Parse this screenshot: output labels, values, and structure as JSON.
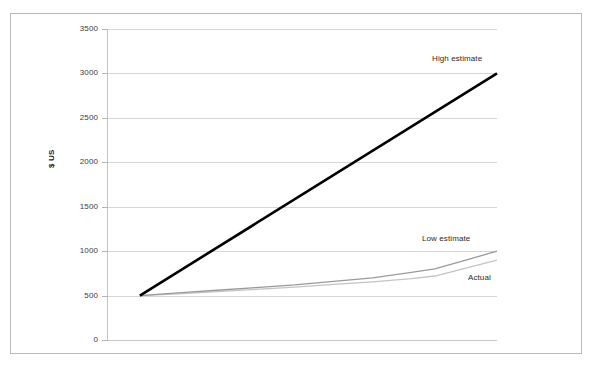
{
  "chart_data": {
    "type": "line",
    "title": "",
    "subtitle": "",
    "xlabel": "",
    "ylabel": "$ US",
    "ylim": [
      0,
      3500
    ],
    "xlim": [
      0,
      10
    ],
    "y_ticks": [
      0,
      500,
      1000,
      1500,
      2000,
      2500,
      3000,
      3500
    ],
    "y_tick_labels": [
      "0",
      "500",
      "1000",
      "1500",
      "2000",
      "2500",
      "3000",
      "3500"
    ],
    "x_ticks": [],
    "x_tick_labels": [],
    "grid": "horizontal",
    "legend": "inline-annotations",
    "series": [
      {
        "name": "High estimate",
        "color": "#000000",
        "width": 2.6,
        "x": [
          0.82,
          10
        ],
        "values": [
          500,
          3000
        ]
      },
      {
        "name": "Low estimate",
        "color": "#9a9a9a",
        "width": 1.3,
        "x": [
          0.82,
          1.8,
          2.8,
          3.8,
          4.8,
          5.8,
          6.8,
          7.8,
          8.4,
          9.2,
          10
        ],
        "values": [
          500,
          530,
          560,
          590,
          620,
          660,
          700,
          760,
          800,
          900,
          1000
        ]
      },
      {
        "name": "Actual",
        "color": "#c3c3c3",
        "width": 1.3,
        "x": [
          0.82,
          1.8,
          2.8,
          3.8,
          4.8,
          5.8,
          6.8,
          7.8,
          8.4,
          9.2,
          10
        ],
        "values": [
          500,
          520,
          545,
          570,
          595,
          625,
          655,
          690,
          720,
          810,
          900
        ]
      }
    ],
    "annotations": [
      {
        "text": "High estimate",
        "x_px": 432,
        "y_px": 54
      },
      {
        "text": "Low estimate",
        "x_px": 422,
        "y_px": 234
      },
      {
        "text": "Actual",
        "x_px": 468,
        "y_px": 273
      }
    ]
  },
  "figure": {
    "border_color": "#b9b9b9",
    "background": "#ffffff",
    "grid_color": "#d6d6d6",
    "axis_color": "#c4c4c4"
  }
}
